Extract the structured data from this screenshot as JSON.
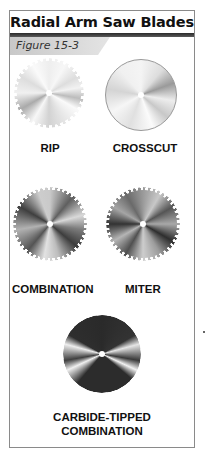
{
  "header": {
    "title": "Radial Arm Saw Blades",
    "figure_label": "Figure 15-3"
  },
  "blades": [
    {
      "name": "rip",
      "label": "RIP"
    },
    {
      "name": "crosscut",
      "label": "CROSSCUT"
    },
    {
      "name": "combination",
      "label": "COMBINATION"
    },
    {
      "name": "miter",
      "label": "MITER"
    },
    {
      "name": "carbide-tipped-combination",
      "label_line1": "CARBIDE-TIPPED",
      "label_line2": "COMBINATION"
    }
  ],
  "colors": {
    "border": "#8a8a8a",
    "title_bar": "#2a2a2a",
    "figure_tab": "#d4d4d4",
    "text": "#111111"
  }
}
